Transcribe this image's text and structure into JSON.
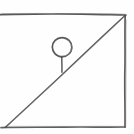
{
  "figure": {
    "title": "Hand-drawn inclined plane with ball",
    "kind": "pencil-sketch",
    "background_color": "#fefefe",
    "stroke_color": "#4a4a4a",
    "stroke_color_light": "#8a8a8a",
    "canvas": {
      "width": 134,
      "height": 134
    }
  },
  "elements": {
    "top_edge": {
      "name": "top-horizontal-line",
      "from": {
        "x": 0,
        "y": 14
      },
      "to": {
        "x": 126,
        "y": 15
      },
      "stroke_width": 1.6
    },
    "right_edge": {
      "name": "right-vertical-line",
      "from": {
        "x": 125,
        "y": 15
      },
      "to": {
        "x": 125,
        "y": 127
      },
      "stroke_width": 1.6
    },
    "bottom_edge": {
      "name": "bottom-horizontal-line",
      "from": {
        "x": 2,
        "y": 127
      },
      "to": {
        "x": 125,
        "y": 127
      },
      "stroke_width": 1.6
    },
    "incline": {
      "name": "diagonal-hypotenuse-line",
      "from": {
        "x": 6,
        "y": 127
      },
      "to": {
        "x": 125,
        "y": 16
      },
      "stroke_width": 1.4
    },
    "ball": {
      "name": "ball-circle",
      "center": {
        "x": 62,
        "y": 47
      },
      "radius": 9.5,
      "stroke_width": 1.6
    },
    "stem": {
      "name": "ball-stem-line",
      "from": {
        "x": 62,
        "y": 57
      },
      "to": {
        "x": 62,
        "y": 72
      },
      "stroke_width": 1.4
    }
  },
  "labels": {
    "none": ""
  }
}
